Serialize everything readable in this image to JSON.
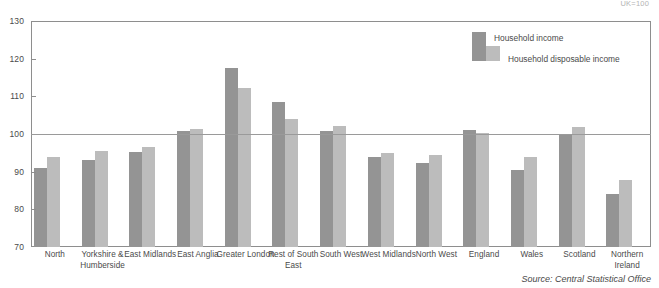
{
  "index_note": "UK=100",
  "source_note": "Source: Central Statistical Office",
  "legend": {
    "primary_label": "Household income",
    "secondary_label": "Household disposable income",
    "primary_color": "#949494",
    "secondary_color": "#bcbcbc"
  },
  "axis": {
    "y_ticks": [
      "130",
      "120",
      "110",
      "100",
      "90",
      "80",
      "70"
    ],
    "reference_line_value": "100"
  },
  "chart_data": {
    "type": "bar",
    "title": "",
    "subtitle": "",
    "xlabel": "",
    "ylabel": "",
    "ylim": [
      70,
      130
    ],
    "ytick_step": 10,
    "grid": false,
    "reference_line": 100,
    "legend_position": "top-right",
    "annotations": [
      "UK=100",
      "Source: Central Statistical Office"
    ],
    "categories": [
      "North",
      "Yorkshire & Humberside",
      "East Midlands",
      "East Anglia",
      "Greater London",
      "Rest of South East",
      "South West",
      "West Midlands",
      "North West",
      "England",
      "Wales",
      "Scotland",
      "Northern Ireland"
    ],
    "series": [
      {
        "name": "Household income",
        "color": "#949494",
        "values": [
          91.0,
          93.2,
          95.3,
          100.8,
          117.5,
          108.6,
          100.8,
          94.0,
          92.4,
          101.0,
          90.4,
          99.7,
          84.2
        ]
      },
      {
        "name": "Household disposable income",
        "color": "#bcbcbc",
        "values": [
          93.8,
          95.6,
          96.5,
          101.4,
          112.3,
          104.1,
          102.2,
          95.0,
          94.5,
          100.4,
          94.0,
          101.8,
          87.8
        ]
      }
    ]
  }
}
